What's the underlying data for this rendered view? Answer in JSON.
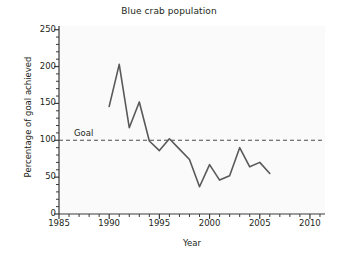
{
  "chart_data": {
    "type": "line",
    "title": "Blue crab population",
    "xlabel": "Year",
    "ylabel": "Percentage of goal achieved",
    "xlim": [
      1985,
      2011.5
    ],
    "ylim": [
      0,
      255
    ],
    "xticks": [
      1985,
      1990,
      1995,
      2000,
      2005,
      2010
    ],
    "xtick_labels": [
      "1985",
      "1990",
      "1995",
      "2000",
      "2005",
      "2010"
    ],
    "x_minor_tick_step": 1,
    "yticks": [
      0,
      50,
      100,
      150,
      200,
      250
    ],
    "ytick_labels": [
      "0",
      "50",
      "100",
      "150",
      "200",
      "250"
    ],
    "y_minor_tick_step": 10,
    "grid": false,
    "legend": null,
    "line_color": "#595959",
    "series": [
      {
        "name": "Percentage of goal achieved",
        "x": [
          1990,
          1991,
          1992,
          1993,
          1994,
          1995,
          1996,
          1997,
          1998,
          1999,
          2000,
          2001,
          2002,
          2003,
          2004,
          2005,
          2006
        ],
        "values": [
          146,
          203,
          117,
          152,
          99,
          86,
          102,
          88,
          74,
          37,
          67,
          46,
          52,
          90,
          64,
          70,
          55
        ]
      }
    ],
    "annotations": [
      {
        "name": "goal-line",
        "type": "hline",
        "label": "Goal",
        "value": 100,
        "style": "dashed",
        "color": "#4d4d4d"
      }
    ]
  }
}
